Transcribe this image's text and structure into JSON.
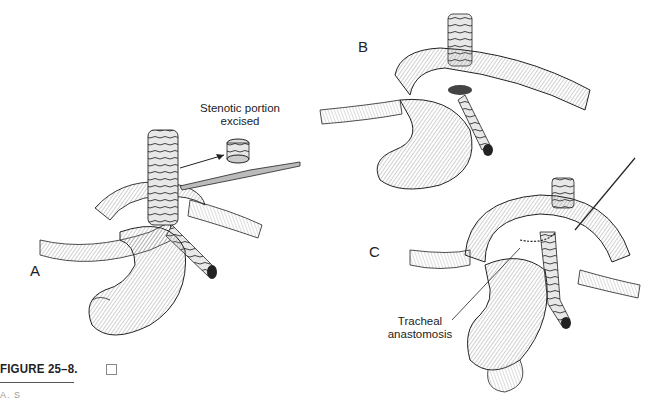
{
  "figure": {
    "title": "FIGURE 25–8.",
    "caption_partial": "A. S",
    "panels": [
      {
        "letter": "A",
        "callout": null
      },
      {
        "letter": "B",
        "callout": null
      },
      {
        "letter": "C",
        "callout": null
      }
    ],
    "callouts": {
      "stenotic_line1": "Stenotic portion",
      "stenotic_line2": "excised",
      "tracheal_line1": "Tracheal",
      "tracheal_line2": "anastomosis"
    }
  },
  "colors": {
    "ink": "#222222",
    "shade": "#9a9a9a",
    "background": "#ffffff"
  }
}
